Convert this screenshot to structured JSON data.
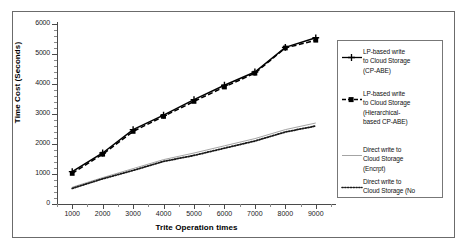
{
  "chart_data": {
    "type": "line",
    "title": "",
    "xlabel": "Trite Operation times",
    "ylabel": "Time Cost (Seconds)",
    "x": [
      1000,
      2000,
      3000,
      4000,
      5000,
      6000,
      7000,
      8000,
      9000
    ],
    "xlim": [
      500,
      9500
    ],
    "ylim": [
      0,
      6000
    ],
    "xticks": [
      "1000",
      "2000",
      "3000",
      "4000",
      "5000",
      "6000",
      "7000",
      "8000",
      "9000"
    ],
    "yticks": [
      "0",
      "1000",
      "2000",
      "3000",
      "4000",
      "5000",
      "6000"
    ],
    "grid": false,
    "legend_position": "right",
    "series": [
      {
        "name": "LP-based write to Cloud Storage (CP-ABE)",
        "legend_label": "LP-based write\nto Cloud Storage\n(CP-ABE)",
        "marker": "cross-plus",
        "linestyle": "solid",
        "color": "#000000",
        "values": [
          1080,
          1700,
          2480,
          2960,
          3480,
          3960,
          4400,
          5220,
          5540
        ]
      },
      {
        "name": "LP-based write to Cloud Storage (Hierarchical-based CP-ABE)",
        "legend_label": "LP-based write\nto Cloud Storage\n(Hierarchical-\nbased CP-ABE)",
        "marker": "square",
        "linestyle": "dashed",
        "color": "#000000",
        "values": [
          1020,
          1660,
          2420,
          2920,
          3420,
          3900,
          4360,
          5200,
          5460
        ]
      },
      {
        "name": "Direct write to Cloud Storage (Encrpt)",
        "legend_label": "Direct write to\nCloud Storage\n(Encrpt)",
        "marker": "none",
        "linestyle": "solid-thin",
        "color": "#9a9a9a",
        "values": [
          560,
          880,
          1180,
          1480,
          1700,
          1940,
          2180,
          2480,
          2700
        ]
      },
      {
        "name": "Direct write to Cloud Storage (No",
        "legend_label": "Direct write to\nCloud Storage (No",
        "marker": "none",
        "linestyle": "dotted",
        "color": "#1a1a1a",
        "values": [
          520,
          840,
          1120,
          1420,
          1620,
          1860,
          2100,
          2400,
          2600
        ]
      }
    ]
  }
}
